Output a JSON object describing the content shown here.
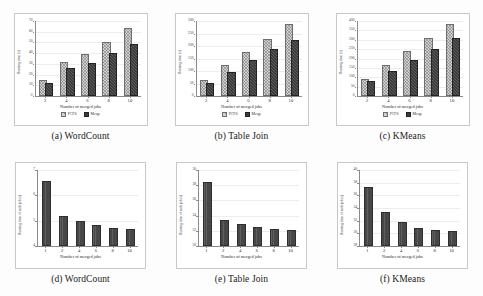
{
  "figure": {
    "shared_xlabel": "Number of merged jobs",
    "top_ylabel": "Running time (s)",
    "bottom_ylabel": "Running time of each job (s)",
    "legend": [
      "FCFS",
      "Merge"
    ],
    "colors": {
      "series_fcfs": "#d2d2d2",
      "series_merge": "#3b3b3b",
      "series_single": "#474747"
    }
  },
  "chart_data": [
    {
      "type": "bar",
      "panel": "a",
      "title": "(a) WordCount",
      "xlabel": "Number of merged jobs",
      "ylabel": "Running time (s)",
      "categories": [
        "2",
        "4",
        "6",
        "8",
        "10"
      ],
      "series": [
        {
          "name": "FCFS",
          "values": [
            13,
            30,
            37,
            49,
            62
          ]
        },
        {
          "name": "Merge",
          "values": [
            10,
            24,
            29,
            38,
            47
          ]
        }
      ],
      "ylim": [
        0,
        70
      ],
      "yticks": [
        0,
        10,
        20,
        30,
        40,
        50,
        60,
        70
      ],
      "grid": true,
      "legend_position": "below"
    },
    {
      "type": "bar",
      "panel": "b",
      "title": "(b) Table Join",
      "xlabel": "Number of merged jobs",
      "ylabel": "Running time (s)",
      "categories": [
        "2",
        "4",
        "6",
        "8",
        "10"
      ],
      "series": [
        {
          "name": "FCFS",
          "values": [
            55,
            115,
            168,
            222,
            280
          ]
        },
        {
          "name": "Merge",
          "values": [
            46,
            90,
            135,
            180,
            218
          ]
        }
      ],
      "ylim": [
        0,
        300
      ],
      "yticks": [
        0,
        50,
        100,
        150,
        200,
        250,
        300
      ],
      "grid": true,
      "legend_position": "below"
    },
    {
      "type": "bar",
      "panel": "c",
      "title": "(c) KMeans",
      "xlabel": "Number of merged jobs",
      "ylabel": "Running time (s)",
      "categories": [
        "2",
        "4",
        "6",
        "8",
        "10"
      ],
      "series": [
        {
          "name": "FCFS",
          "values": [
            80,
            155,
            228,
            300,
            375
          ]
        },
        {
          "name": "Merge",
          "values": [
            68,
            125,
            180,
            240,
            298
          ]
        }
      ],
      "ylim": [
        0,
        400
      ],
      "yticks": [
        0,
        50,
        100,
        150,
        200,
        250,
        300,
        350,
        400
      ],
      "grid": true,
      "legend_position": "below"
    },
    {
      "type": "bar",
      "panel": "d",
      "title": "(d) WordCount",
      "xlabel": "Number of merged jobs",
      "ylabel": "Running time of each job (s)",
      "categories": [
        "1",
        "2",
        "4",
        "6",
        "8",
        "10"
      ],
      "values": [
        6.5,
        5.1,
        4.9,
        4.75,
        4.65,
        4.6
      ],
      "ylim": [
        4,
        7
      ],
      "yticks": [
        4,
        5,
        6,
        7
      ],
      "grid": true,
      "legend_position": "none"
    },
    {
      "type": "bar",
      "panel": "e",
      "title": "(e) Table Join",
      "xlabel": "Number of merged jobs",
      "ylabel": "Running time of each job (s)",
      "categories": [
        "1",
        "2",
        "4",
        "6",
        "8",
        "10"
      ],
      "values": [
        28.2,
        23.2,
        22.6,
        22.2,
        22.0,
        21.9
      ],
      "ylim": [
        20,
        30
      ],
      "yticks": [
        20,
        22,
        24,
        26,
        28,
        30
      ],
      "grid": true,
      "legend_position": "none"
    },
    {
      "type": "bar",
      "panel": "f",
      "title": "(f) KMeans",
      "xlabel": "Number of merged jobs",
      "ylabel": "Running time of each job (s)",
      "categories": [
        "1",
        "2",
        "4",
        "6",
        "8",
        "10"
      ],
      "values": [
        37.0,
        33.0,
        31.4,
        30.6,
        30.2,
        30.0
      ],
      "ylim": [
        28,
        40
      ],
      "yticks": [
        28,
        30,
        32,
        34,
        36,
        38,
        40
      ],
      "grid": true,
      "legend_position": "none"
    }
  ]
}
